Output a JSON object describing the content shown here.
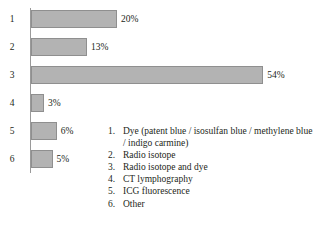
{
  "chart_data": {
    "type": "bar",
    "orientation": "horizontal",
    "title": "",
    "xlabel": "",
    "ylabel": "",
    "grid": false,
    "xlim": [
      0,
      60
    ],
    "categories": [
      "1",
      "2",
      "3",
      "4",
      "5",
      "6"
    ],
    "values": [
      20,
      13,
      54,
      3,
      6,
      5
    ],
    "value_labels": [
      "20%",
      "13%",
      "54%",
      "3%",
      "6%",
      "5%"
    ],
    "legend_position": "bottom-right",
    "legend": [
      {
        "num": "1.",
        "label": "Dye (patent blue / isosulfan blue / methylene blue / indigo carmine)"
      },
      {
        "num": "2.",
        "label": "Radio isotope"
      },
      {
        "num": "3.",
        "label": "Radio isotope and dye"
      },
      {
        "num": "4.",
        "label": "CT lymphography"
      },
      {
        "num": "5.",
        "label": "ICG fluorescence"
      },
      {
        "num": "6.",
        "label": "Other"
      }
    ],
    "colors": {
      "bar_fill": "#b3b3b3",
      "bar_border": "#8f8f8f",
      "axis": "#9a9a9a",
      "text": "#231f20",
      "background": "#ffffff"
    }
  }
}
